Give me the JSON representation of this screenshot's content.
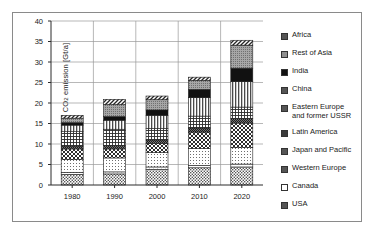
{
  "chart_data": {
    "type": "bar",
    "subtype": "stacked",
    "title": "",
    "xlabel": "",
    "ylabel": "CO2 emission [Gt/a]",
    "ylabel_display": "CO₂ emission [Gt/a]",
    "categories": [
      "1980",
      "1990",
      "2000",
      "2010",
      "2020"
    ],
    "ylim": [
      0,
      40
    ],
    "yticks": [
      0,
      5,
      10,
      15,
      20,
      25,
      30,
      35,
      40
    ],
    "grid": true,
    "legend_position": "right",
    "series": [
      {
        "name": "USA",
        "pattern": "medium-stipple",
        "values": [
          2.6,
          2.7,
          3.8,
          4.2,
          4.4
        ]
      },
      {
        "name": "Canada",
        "pattern": "blank-white",
        "values": [
          0.5,
          0.5,
          0.6,
          0.6,
          0.7
        ]
      },
      {
        "name": "Western Europe",
        "pattern": "light-dots",
        "values": [
          3.1,
          3.4,
          3.5,
          4.1,
          4.0
        ]
      },
      {
        "name": "Japan and Pacific",
        "pattern": "checkerboard",
        "values": [
          2.6,
          2.2,
          2.2,
          4.0,
          6.0
        ]
      },
      {
        "name": "Latin America",
        "pattern": "dark-stipple",
        "values": [
          0.7,
          0.8,
          0.9,
          1.0,
          1.1
        ]
      },
      {
        "name": "Eastern Europe and former USSR",
        "pattern": "fine-grid",
        "values": [
          3.5,
          4.0,
          2.8,
          2.9,
          2.8
        ]
      },
      {
        "name": "China",
        "pattern": "vertical-lines",
        "values": [
          1.6,
          2.2,
          3.2,
          4.5,
          6.2
        ]
      },
      {
        "name": "India",
        "pattern": "solid-black",
        "values": [
          0.6,
          0.9,
          1.3,
          2.0,
          3.3
        ]
      },
      {
        "name": "Rest of Asia",
        "pattern": "gray-stipple",
        "values": [
          1.1,
          2.9,
          2.5,
          2.2,
          5.6
        ]
      },
      {
        "name": "Africa",
        "pattern": "diagonal-hatch",
        "values": [
          0.7,
          1.3,
          0.9,
          0.8,
          1.2
        ]
      }
    ],
    "legend_entries": [
      {
        "label": "Africa",
        "pattern": "diagonal-hatch"
      },
      {
        "label": "Rest of Asia",
        "pattern": "gray-stipple"
      },
      {
        "label": "India",
        "pattern": "solid-black"
      },
      {
        "label": "China",
        "pattern": "vertical-lines"
      },
      {
        "label": "Eastern Europe\nand former USSR",
        "pattern": "fine-grid"
      },
      {
        "label": "Latin America",
        "pattern": "dark-stipple"
      },
      {
        "label": "Japan and Pacific",
        "pattern": "checkerboard"
      },
      {
        "label": "Western Europe",
        "pattern": "light-dots"
      },
      {
        "label": "Canada",
        "pattern": "blank-white"
      },
      {
        "label": "USA",
        "pattern": "medium-stipple"
      }
    ],
    "totals": [
      16.9,
      20.8,
      21.6,
      26.3,
      35.2
    ]
  },
  "colors": {
    "frame": "#8a8a8a",
    "axis": "#2b2b2b",
    "grid": "#9a9a9a",
    "text": "#1a1a1a",
    "plot_background": "#ffffff"
  }
}
